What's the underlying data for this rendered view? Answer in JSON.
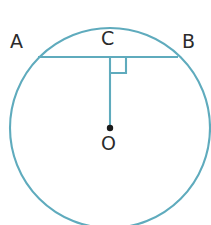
{
  "figure": {
    "background_color": "#ffffff",
    "width": 211,
    "height": 225
  },
  "style": {
    "stroke_color": "#5fabbd",
    "stroke_color_dark": "#4a9aad",
    "label_color": "#2b2b2b",
    "center_dot_color": "#1a1a1a",
    "stroke_width": 2.1
  },
  "labels": {
    "point_a": "A",
    "point_b": "B",
    "point_c": "C",
    "point_o": "O"
  },
  "geometry": {
    "circle": {
      "center_x": 110,
      "center_y": 128,
      "radius": 100
    },
    "chord_ab": {
      "x1": 38,
      "y1": 57,
      "x2": 178,
      "y2": 57
    },
    "radius_oc": {
      "x1": 110,
      "y1": 57,
      "x2": 110,
      "y2": 128
    },
    "right_angle_marker": {
      "x": 110,
      "y": 57,
      "size": 16,
      "opens": "down-right"
    },
    "center_dot": {
      "cx": 110,
      "cy": 128,
      "r": 3.2
    }
  },
  "annotations": {
    "icon_right_angle": "right-angle-icon",
    "icon_center_point": "center-point-icon"
  }
}
